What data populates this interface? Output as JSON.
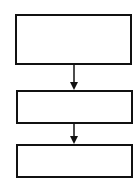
{
  "diagram": {
    "type": "flowchart",
    "direction": "top-to-bottom",
    "stroke_color": "#111111",
    "background": "#ffffff",
    "nodes": [
      {
        "id": "box-1",
        "label": "",
        "x": 15,
        "y": 14,
        "w": 117,
        "h": 51
      },
      {
        "id": "box-2",
        "label": "",
        "x": 16,
        "y": 90,
        "w": 117,
        "h": 34
      },
      {
        "id": "box-3",
        "label": "",
        "x": 16,
        "y": 144,
        "w": 117,
        "h": 34
      }
    ],
    "edges": [
      {
        "from": "box-1",
        "to": "box-2"
      },
      {
        "from": "box-2",
        "to": "box-3"
      }
    ]
  }
}
